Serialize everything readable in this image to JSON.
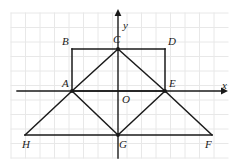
{
  "figure": {
    "type": "geometry-diagram",
    "background_color": "#ffffff",
    "grid": {
      "visible": true,
      "color": "#e8e8e8",
      "cell_size": 14.5,
      "x_start": 11,
      "y_start": 13,
      "x_end": 228,
      "y_end": 158
    },
    "axes": {
      "color": "#1a1a1a",
      "x_axis": {
        "label": "x",
        "label_x": 222,
        "label_y": 80,
        "from_x": 17,
        "to_x": 221,
        "y": 91
      },
      "y_axis": {
        "label": "y",
        "label_x": 123,
        "label_y": 20,
        "x": 118,
        "from_y": 158,
        "to_y": 16
      },
      "origin_label": "O",
      "origin_label_x": 122,
      "origin_label_y": 94
    },
    "shape_color": "#1a1a1a",
    "points": [
      {
        "id": "A",
        "label": "A",
        "x": 72,
        "y": 91,
        "label_x": 62,
        "label_y": 78,
        "dot": true
      },
      {
        "id": "B",
        "label": "B",
        "x": 72,
        "y": 49,
        "label_x": 62,
        "label_y": 36,
        "dot": false
      },
      {
        "id": "C",
        "label": "C",
        "x": 118,
        "y": 49,
        "label_x": 113,
        "label_y": 34,
        "dot": true
      },
      {
        "id": "D",
        "label": "D",
        "x": 165,
        "y": 49,
        "label_x": 168,
        "label_y": 36,
        "dot": false
      },
      {
        "id": "E",
        "label": "E",
        "x": 165,
        "y": 91,
        "label_x": 169,
        "label_y": 78,
        "dot": true
      },
      {
        "id": "F",
        "label": "F",
        "x": 212,
        "y": 135,
        "label_x": 205,
        "label_y": 139,
        "dot": false
      },
      {
        "id": "G",
        "label": "G",
        "x": 118,
        "y": 135,
        "label_x": 119,
        "label_y": 139,
        "dot": true
      },
      {
        "id": "H",
        "label": "H",
        "x": 25,
        "y": 135,
        "label_x": 22,
        "label_y": 139,
        "dot": false
      }
    ],
    "segments": [
      {
        "name": "B-D-top",
        "x1": 72,
        "y1": 49,
        "x2": 165,
        "y2": 49
      },
      {
        "name": "B-A-left",
        "x1": 72,
        "y1": 49,
        "x2": 72,
        "y2": 91
      },
      {
        "name": "D-E-right",
        "x1": 165,
        "y1": 49,
        "x2": 165,
        "y2": 91
      },
      {
        "name": "A-E-base",
        "x1": 72,
        "y1": 91,
        "x2": 165,
        "y2": 91
      },
      {
        "name": "A-C-diagonal",
        "x1": 72,
        "y1": 91,
        "x2": 118,
        "y2": 49
      },
      {
        "name": "C-E-diagonal",
        "x1": 118,
        "y1": 49,
        "x2": 165,
        "y2": 91
      },
      {
        "name": "A-G-diagonal",
        "x1": 72,
        "y1": 91,
        "x2": 118,
        "y2": 135
      },
      {
        "name": "G-E-diagonal",
        "x1": 118,
        "y1": 135,
        "x2": 165,
        "y2": 91
      },
      {
        "name": "H-A-outer-left",
        "x1": 25,
        "y1": 135,
        "x2": 72,
        "y2": 91
      },
      {
        "name": "E-F-outer-right",
        "x1": 165,
        "y1": 91,
        "x2": 212,
        "y2": 135
      },
      {
        "name": "H-F-bottom",
        "x1": 25,
        "y1": 135,
        "x2": 212,
        "y2": 135
      }
    ]
  }
}
